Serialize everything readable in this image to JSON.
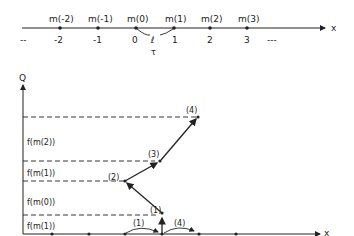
{
  "top_axis": {
    "axis_label": "x",
    "left_ellipsis": "--",
    "right_ellipsis": "---",
    "points": [
      {
        "name": "m(-2)",
        "tick": "-2"
      },
      {
        "name": "m(-1)",
        "tick": "-1"
      },
      {
        "name": "m(0)",
        "tick": "0"
      },
      {
        "name": "m(1)",
        "tick": "1"
      },
      {
        "name": "m(2)",
        "tick": "2"
      },
      {
        "name": "m(3)",
        "tick": "3"
      }
    ],
    "link_symbol": "ℓ",
    "link_subscript": "τ"
  },
  "bottom_graph": {
    "y_axis_label": "Q",
    "x_axis_label": "x",
    "interval_labels": [
      "f(m(2))",
      "f(m(1))",
      "f(m(0))",
      "f(m(1))"
    ],
    "step_labels": [
      "(1)",
      "(2)",
      "(3)",
      "(4)"
    ],
    "arc_labels": [
      "(1)",
      "(4)"
    ]
  }
}
